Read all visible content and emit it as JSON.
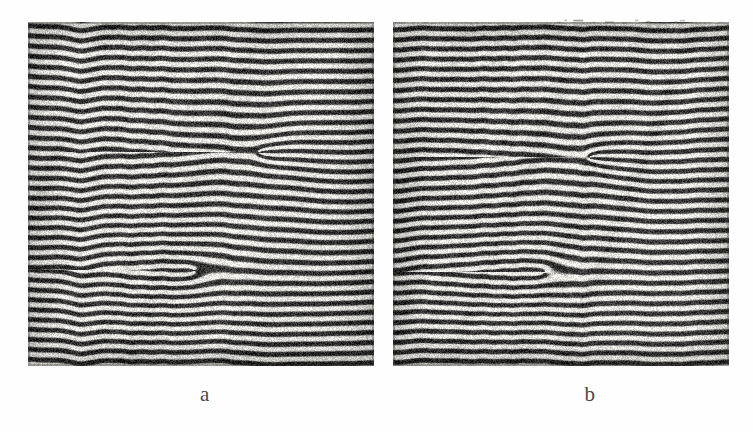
{
  "figure": {
    "type": "interferogram-pair",
    "background_color": "#fefefe",
    "ink_color": "#3a3834",
    "paper_color": "#f3f2f0",
    "caption_color": "#4a4845"
  },
  "panels": [
    {
      "id": "a",
      "label": "a",
      "x": 28,
      "y": 22,
      "width": 346,
      "height": 344,
      "fringe_period_px": 10.1,
      "fringe_count": 34,
      "tilt_deg": -0.6,
      "description": "Horizontal interference fringe pattern with two edge dislocations",
      "dislocations": [
        {
          "name": "upper-dislocation",
          "cx": 230,
          "cy": 130,
          "rx": 78,
          "ry": 52,
          "charge": 1
        },
        {
          "name": "lower-dislocation",
          "cx": 165,
          "cy": 248,
          "rx": 82,
          "ry": 48,
          "charge": -1
        }
      ]
    },
    {
      "id": "b",
      "label": "b",
      "x": 393,
      "y": 22,
      "width": 336,
      "height": 344,
      "fringe_period_px": 10.1,
      "fringe_count": 34,
      "tilt_deg": -0.5,
      "description": "Horizontal interference fringe pattern with two edge dislocations",
      "dislocations": [
        {
          "name": "upper-dislocation",
          "cx": 195,
          "cy": 135,
          "rx": 74,
          "ry": 50,
          "charge": 1
        },
        {
          "name": "lower-dislocation",
          "cx": 150,
          "cy": 250,
          "rx": 78,
          "ry": 46,
          "charge": -1
        }
      ]
    }
  ],
  "annotations": {
    "dotted_marks_above_panel_b": {
      "present": true,
      "x": 555,
      "y": 18,
      "width": 120,
      "description": "Faint broken dotted line fragment above top edge of panel b"
    }
  },
  "chart_data": {
    "type": "heatmap",
    "title": "",
    "xlabel": "",
    "ylabel": "",
    "subplots": [
      {
        "label": "a",
        "field": "cos(2*pi*y/10.1 + phase_dislocation_field)",
        "fringe_orientation": "horizontal",
        "fringe_period": 10.1,
        "singularities": [
          {
            "x": 230,
            "y": 130,
            "topological_charge": 1
          },
          {
            "x": 165,
            "y": 248,
            "topological_charge": -1
          }
        ]
      },
      {
        "label": "b",
        "field": "cos(2*pi*y/10.1 + phase_dislocation_field)",
        "fringe_orientation": "horizontal",
        "fringe_period": 10.1,
        "singularities": [
          {
            "x": 195,
            "y": 135,
            "topological_charge": 1
          },
          {
            "x": 150,
            "y": 250,
            "topological_charge": -1
          }
        ]
      }
    ],
    "grid": false,
    "legend": "none"
  }
}
